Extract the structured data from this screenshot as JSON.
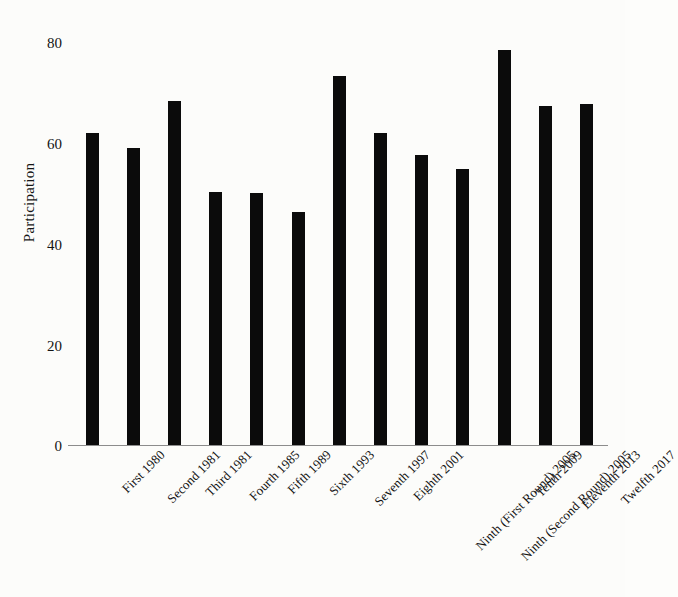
{
  "chart_data": {
    "type": "bar",
    "title": "",
    "xlabel": "",
    "ylabel": "Participation",
    "ylim": [
      0,
      88
    ],
    "yticks": [
      0,
      20,
      40,
      60,
      80
    ],
    "ytick_labels": [
      "0",
      "20",
      "40",
      "60",
      "80"
    ],
    "grid": false,
    "legend": false,
    "bar_color": "#0b0b0b",
    "background_color": "#fcfcfa",
    "categories": [
      "First 1980",
      "Second 1981",
      "Third 1981",
      "Fourth 1985",
      "Fifth 1989",
      "Sixth 1993",
      "Seventh 1997",
      "Eighth 2001",
      "Ninth (First Round) 2005",
      "Ninth (Second Round) 2005",
      "Tenth 2009",
      "Eleventh 2013",
      "Twelfth 2017"
    ],
    "values": [
      67.9,
      64.5,
      74.8,
      54.9,
      54.7,
      50.7,
      80.1,
      67.7,
      63.1,
      59.9,
      85.9,
      73.6,
      74.0
    ]
  }
}
